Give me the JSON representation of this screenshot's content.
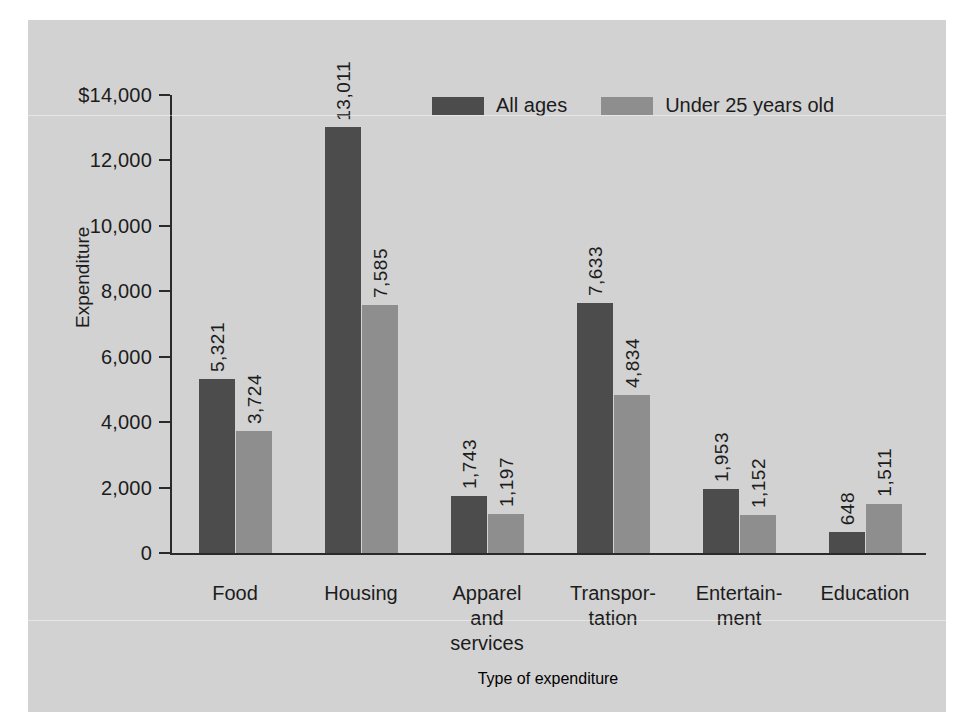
{
  "chart_data": {
    "type": "bar",
    "title": "",
    "xlabel": "Type of expenditure",
    "ylabel": "Expenditure",
    "categories": [
      "Food",
      "Housing",
      "Apparel and services",
      "Transportation",
      "Entertainment",
      "Education"
    ],
    "category_display": [
      [
        "Food"
      ],
      [
        "Housing"
      ],
      [
        "Apparel",
        "and",
        "services"
      ],
      [
        "Transpor-",
        "tation"
      ],
      [
        "Entertain-",
        "ment"
      ],
      [
        "Education"
      ]
    ],
    "series": [
      {
        "name": "All ages",
        "color": "#4c4c4c",
        "values": [
          5321,
          13011,
          1743,
          7633,
          1953,
          648
        ],
        "labels": [
          "5,321",
          "13,011",
          "1,743",
          "7,633",
          "1,953",
          "648"
        ]
      },
      {
        "name": "Under 25 years old",
        "color": "#8e8e8e",
        "values": [
          3724,
          7585,
          1197,
          4834,
          1152,
          1511
        ],
        "labels": [
          "3,724",
          "7,585",
          "1,197",
          "4,834",
          "1,152",
          "1,511"
        ]
      }
    ],
    "ylim": [
      0,
      14000
    ],
    "yticks": [
      0,
      2000,
      4000,
      6000,
      8000,
      10000,
      12000,
      14000
    ],
    "ytick_labels": [
      "0",
      "2,000",
      "4,000",
      "6,000",
      "8,000",
      "10,000",
      "12,000",
      "$14,000"
    ],
    "grid": false,
    "legend_position": "top-center",
    "currency_symbol": "$"
  },
  "legend": {
    "items": [
      {
        "label": "All ages",
        "swatch": "dark"
      },
      {
        "label": "Under 25 years old",
        "swatch": "light"
      }
    ]
  },
  "axes": {
    "y_title": "Expenditure",
    "x_title": "Type of expenditure"
  }
}
